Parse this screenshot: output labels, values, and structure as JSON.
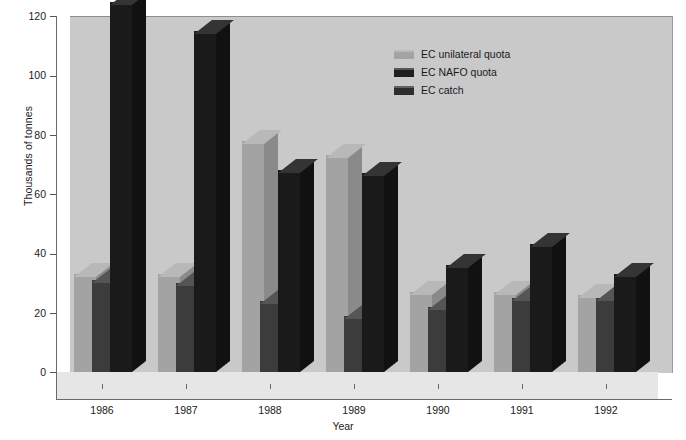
{
  "chart": {
    "type": "bar",
    "title": "",
    "ylabel": "Thousands of tonnes",
    "xlabel": "Year"
  },
  "axis": {
    "y_ticks": [
      "0",
      "20",
      "40",
      "60",
      "80",
      "100",
      "120"
    ],
    "y_min": 0,
    "y_max": 120,
    "x_ticks": [
      "1986",
      "1987",
      "1988",
      "1989",
      "1990",
      "1991",
      "1992"
    ]
  },
  "legend": {
    "position": "top-right",
    "items": [
      {
        "label": "EC unilateral quota",
        "color": "#a3a3a3"
      },
      {
        "label": "EC NAFO quota",
        "color": "#1f1f1f"
      },
      {
        "label": "EC catch",
        "color": "#2e2e2e"
      }
    ]
  },
  "colors": {
    "background": "#ffffff",
    "back_wall": "#c9c9c9",
    "floor": "#e6e6e6",
    "axis": "#6a6a6a",
    "text": "#1a1a1a",
    "series_unilateral": "#a3a3a3",
    "series_nafo": "#3c3c3c",
    "series_catch": "#1a1a1a"
  },
  "chart_data": {
    "type": "bar",
    "title": "",
    "xlabel": "Year",
    "ylabel": "Thousands of tonnes",
    "ylim": [
      0,
      120
    ],
    "grid": false,
    "legend_position": "top-right",
    "categories": [
      "1986",
      "1987",
      "1988",
      "1989",
      "1990",
      "1991",
      "1992"
    ],
    "series": [
      {
        "name": "EC unilateral quota",
        "color": "#a3a3a3",
        "values": [
          33,
          33,
          78,
          73,
          27,
          27,
          26
        ]
      },
      {
        "name": "EC NAFO quota",
        "color": "#3c3c3c",
        "values": [
          31,
          30,
          24,
          19,
          22,
          25,
          25
        ]
      },
      {
        "name": "EC catch",
        "color": "#1a1a1a",
        "values": [
          165,
          115,
          68,
          67,
          36,
          43,
          33
        ]
      }
    ]
  }
}
